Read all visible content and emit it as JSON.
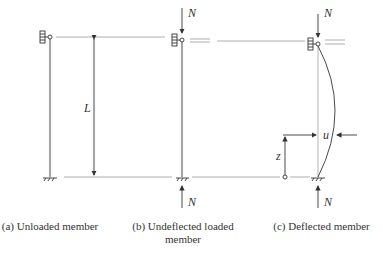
{
  "diagram": {
    "labels": {
      "length": "L",
      "load_top_b": "N",
      "load_bottom_b": "N",
      "load_top_c": "N",
      "load_bottom_c": "N",
      "deflection": "u",
      "height": "z"
    },
    "captions": {
      "a": "(a) Unloaded member",
      "b_line1": "(b) Undeflected loaded",
      "b_line2": "member",
      "c": "(c) Deflected member"
    },
    "colors": {
      "line": "#333333",
      "guide": "#999999"
    }
  }
}
